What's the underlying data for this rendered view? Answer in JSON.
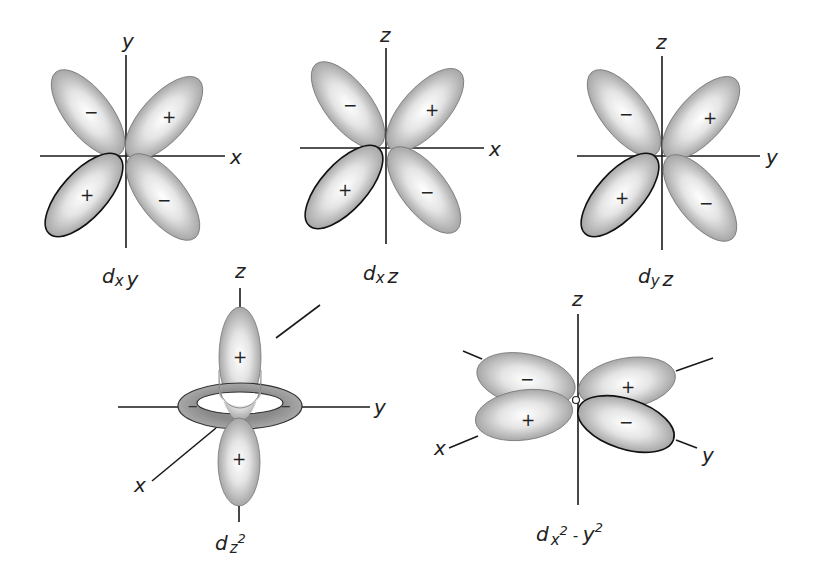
{
  "figure": {
    "lobe_fill_color": "#b3b3b3",
    "outline_color": "#111111"
  },
  "orbitals": [
    {
      "id": "dxy",
      "title": {
        "main": "d",
        "sub1": "x",
        "sub2": "y"
      },
      "axes": {
        "vertical": "y",
        "horizontal": "x"
      },
      "signs": {
        "upper_left": "−",
        "upper_right": "+",
        "lower_left": "+",
        "lower_right": "−"
      }
    },
    {
      "id": "dxz",
      "title": {
        "main": "d",
        "sub1": "x",
        "sub2": "z"
      },
      "axes": {
        "vertical": "z",
        "horizontal": "x"
      },
      "signs": {
        "upper_left": "−",
        "upper_right": "+",
        "lower_left": "+",
        "lower_right": "−"
      }
    },
    {
      "id": "dyz",
      "title": {
        "main": "d",
        "sub1": "y",
        "sub2": "z"
      },
      "axes": {
        "vertical": "z",
        "horizontal": "y"
      },
      "signs": {
        "upper_left": "−",
        "upper_right": "+",
        "lower_left": "+",
        "lower_right": "−"
      }
    },
    {
      "id": "dz2",
      "title": {
        "main": "d",
        "sub1": "z",
        "sup": "2"
      },
      "axes": {
        "vertical": "z",
        "horizontal": "y",
        "diagonal": "x"
      },
      "signs": {
        "top": "+",
        "bottom": "+",
        "ring_left": "−",
        "ring_right": "−"
      }
    },
    {
      "id": "dx2-y2",
      "title": {
        "main": "d",
        "sub1": "x",
        "sup1": "2",
        "sep": " - ",
        "sub2": "y",
        "sup2": "2"
      },
      "axes": {
        "vertical": "z",
        "diag_left": "x",
        "diag_right": "y"
      },
      "signs": {
        "upper_left": "−",
        "upper_right": "+",
        "lower_left": "+",
        "lower_right": "−"
      }
    }
  ]
}
